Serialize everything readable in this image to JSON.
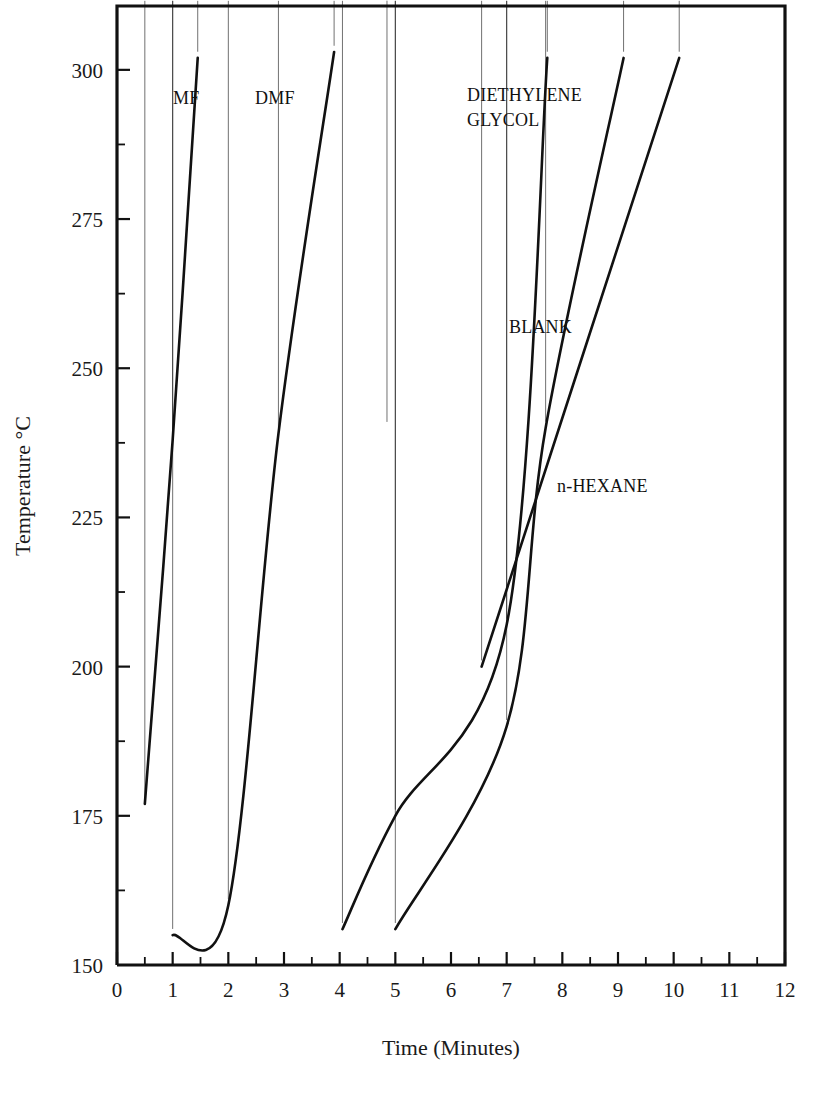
{
  "figure": {
    "background_color": "#ffffff",
    "ink_color": "#111111"
  },
  "axes": {
    "x_title": "Time (Minutes)",
    "y_title": "Temperature °C",
    "x_tick_labels": [
      "0",
      "1",
      "2",
      "3",
      "4",
      "5",
      "6",
      "7",
      "8",
      "9",
      "10",
      "11",
      "12"
    ],
    "y_tick_labels": [
      "150",
      "175",
      "200",
      "225",
      "250",
      "275",
      "300"
    ]
  },
  "series_labels": {
    "mf": "MF",
    "dmf": "DMF",
    "diethylene_glycol_line1": "DIETHYLENE",
    "diethylene_glycol_line2": "GLYCOL",
    "blank": "BLANK",
    "n_hexane": "n-HEXANE"
  },
  "chart_data": {
    "type": "line",
    "title": "",
    "xlabel": "Time (Minutes)",
    "ylabel": "Temperature °C",
    "xlim": [
      0,
      12
    ],
    "ylim": [
      150,
      310.7
    ],
    "x_major_ticks": [
      0,
      1,
      2,
      3,
      4,
      5,
      6,
      7,
      8,
      9,
      10,
      11,
      12
    ],
    "x_minor_tick_step": 0.5,
    "y_major_ticks": [
      150,
      175,
      200,
      225,
      250,
      275,
      300
    ],
    "y_minor_tick_step": 12.5,
    "grid": false,
    "legend": "inline-labels",
    "marker": "filled-diamond",
    "series": [
      {
        "name": "MF",
        "label_position": {
          "x": 1.1,
          "y": 292
        },
        "points": [
          {
            "x": 0.5,
            "y": 177
          },
          {
            "x": 1.0,
            "y": 238
          },
          {
            "x": 1.45,
            "y": 302
          }
        ]
      },
      {
        "name": "DMF",
        "label_position": {
          "x": 2.55,
          "y": 292
        },
        "points": [
          {
            "x": 1.0,
            "y": 155
          },
          {
            "x": 2.0,
            "y": 160
          },
          {
            "x": 2.9,
            "y": 239
          },
          {
            "x": 3.9,
            "y": 303
          }
        ]
      },
      {
        "name": "DIETHYLENE GLYCOL",
        "label_position": {
          "x": 6.25,
          "y": 295
        },
        "points": [
          {
            "x": 4.05,
            "y": 156
          },
          {
            "x": 5.0,
            "y": 175
          },
          {
            "x": 7.0,
            "y": 207
          },
          {
            "x": 7.73,
            "y": 302
          }
        ]
      },
      {
        "name": "BLANK",
        "label_position": {
          "x": 7.05,
          "y": 254
        },
        "points": [
          {
            "x": 5.0,
            "y": 156
          },
          {
            "x": 7.0,
            "y": 190
          },
          {
            "x": 7.7,
            "y": 240
          },
          {
            "x": 9.1,
            "y": 302
          }
        ]
      },
      {
        "name": "n-HEXANE",
        "label_position": {
          "x": 7.95,
          "y": 231
        },
        "points": [
          {
            "x": 6.55,
            "y": 200
          },
          {
            "x": 10.1,
            "y": 302
          }
        ]
      }
    ],
    "isolated_points": [
      {
        "x": 4.85,
        "y": 240,
        "note": "unconnected marker"
      }
    ]
  }
}
